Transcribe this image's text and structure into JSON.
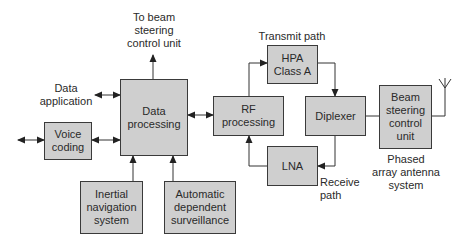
{
  "diagram": {
    "colors": {
      "box_fill": "#cfcfcf",
      "box_border": "#3a3a3a",
      "line": "#333333",
      "text": "#2a2a2a"
    },
    "blocks": {
      "voice_coding": "Voice\ncoding",
      "data_processing": "Data\nprocessing",
      "inertial_navigation": "Inertial\nnavigation\nsystem",
      "automatic_dependent_surveillance": "Automatic\ndependent\nsurveillance",
      "rf_processing": "RF\nprocessing",
      "hpa": "HPA\nClass A",
      "lna": "LNA",
      "diplexer": "Diplexer",
      "beam_steering": "Beam\nsteering\ncontrol\nunit"
    },
    "labels": {
      "to_beam_steering": "To beam\nsteering\ncontrol unit",
      "data_application": "Data\napplication",
      "transmit_path": "Transmit path",
      "receive_path": "Receive\npath",
      "phased_array": "Phased\narray antenna\nsystem"
    }
  }
}
